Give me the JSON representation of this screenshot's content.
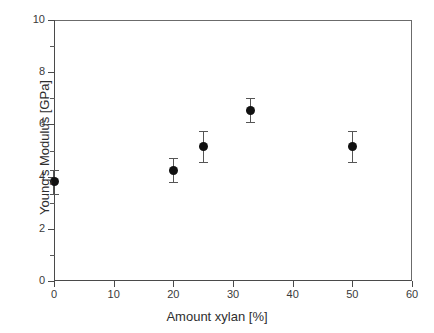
{
  "chart_data": {
    "type": "scatter",
    "title": "",
    "xlabel": "Amount xylan  [%]",
    "ylabel": "Young's Modulus  [GPa]",
    "xlim": [
      0,
      60
    ],
    "ylim": [
      0,
      10
    ],
    "xticks": [
      0,
      10,
      20,
      30,
      40,
      50,
      60
    ],
    "yticks": [
      0,
      2,
      4,
      6,
      8,
      10
    ],
    "xtick_labels": [
      "0",
      "10",
      "20",
      "30",
      "40",
      "50",
      "60"
    ],
    "ytick_labels": [
      "0",
      "2",
      "4",
      "6",
      "8",
      "10"
    ],
    "y_minor_ticks": [
      1,
      3,
      5,
      7,
      9
    ],
    "grid": false,
    "legend": false,
    "marker": "filled-circle",
    "marker_color": "#111111",
    "errorbar_color": "#555555",
    "x": [
      0,
      20,
      25,
      33,
      50
    ],
    "y": [
      3.8,
      4.25,
      5.15,
      6.55,
      5.15
    ],
    "yerr": [
      0.45,
      0.45,
      0.6,
      0.45,
      0.6
    ],
    "points": [
      {
        "x": 0,
        "y": 3.8,
        "yerr": 0.45
      },
      {
        "x": 20,
        "y": 4.25,
        "yerr": 0.45
      },
      {
        "x": 25,
        "y": 5.15,
        "yerr": 0.6
      },
      {
        "x": 33,
        "y": 6.55,
        "yerr": 0.45
      },
      {
        "x": 50,
        "y": 5.15,
        "yerr": 0.6
      }
    ]
  }
}
